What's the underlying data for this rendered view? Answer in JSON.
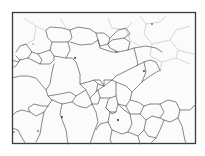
{
  "image": {
    "subject": "grain-boundary-micrograph",
    "description": "Black-bordered optical micrograph of polycrystalline grain structure with dark grain boundary lines on a white background",
    "colors": {
      "background": "#ffffff",
      "border": "#3a3a3a",
      "boundaries": "#555555",
      "faint_boundaries": "#bdbdbd"
    },
    "frame": {
      "x": 12,
      "y": 12,
      "width": 184,
      "height": 132
    }
  }
}
